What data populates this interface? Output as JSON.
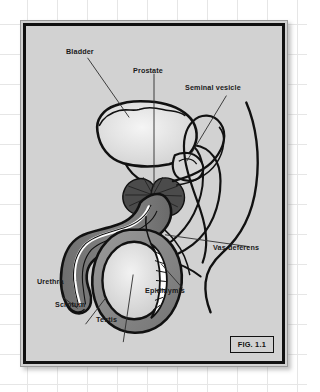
{
  "figure": {
    "caption": "FIG. 1.1",
    "panel_color": "#d2d2d2",
    "frame_color": "#111111",
    "background": "graph-paper-grid",
    "grid_line_color": "#e6e6e6"
  },
  "labels": {
    "bladder": "Bladder",
    "prostate": "Prostate",
    "seminal_vesicle": "Seminal vesicle",
    "vas_deferens": "Vas deferens",
    "epididymis": "Epididymis",
    "testis": "Testis",
    "scrotum": "Scrotum",
    "urethra": "Urethra"
  },
  "structures": [
    {
      "name": "bladder",
      "label": "Bladder",
      "fill": "#e8e8e8"
    },
    {
      "name": "prostate",
      "label": "Prostate",
      "fill": "#4a4a4a"
    },
    {
      "name": "seminal-vesicle",
      "label": "Seminal vesicle",
      "fill": "#d2d2d2"
    },
    {
      "name": "vas-deferens",
      "label": "Vas deferens",
      "fill": "none"
    },
    {
      "name": "epididymis",
      "label": "Epididymis",
      "fill": "#ffffff"
    },
    {
      "name": "testis",
      "label": "Testis",
      "fill": "#e3e3e3"
    },
    {
      "name": "scrotum",
      "label": "Scrotum",
      "fill": "#8d8d8d"
    },
    {
      "name": "urethra",
      "label": "Urethra",
      "fill": "#ffffff"
    },
    {
      "name": "penis-shaft",
      "label": "Penis",
      "fill": "#7c7c7c"
    }
  ]
}
